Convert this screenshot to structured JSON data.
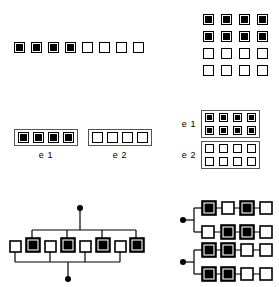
{
  "figure": {
    "colors": {
      "filled": "#000000",
      "empty": "#ffffff",
      "outline": "#000000",
      "group_box": "#555555",
      "background": "#ffffff"
    },
    "legend": {
      "filled_meaning": "filled cell",
      "empty_meaning": "empty cell"
    }
  },
  "panels": {
    "top_left": {
      "name": "single-row-sequence",
      "type": "row",
      "cell_count": 8,
      "cells": [
        "filled",
        "filled",
        "filled",
        "filled",
        "empty",
        "empty",
        "empty",
        "empty"
      ]
    },
    "top_right": {
      "name": "four-by-four-grid",
      "type": "grid",
      "rows": 4,
      "cols": 4,
      "cells": [
        [
          "filled",
          "filled",
          "filled",
          "filled"
        ],
        [
          "filled",
          "filled",
          "filled",
          "filled"
        ],
        [
          "empty",
          "empty",
          "empty",
          "empty"
        ],
        [
          "empty",
          "empty",
          "empty",
          "empty"
        ]
      ]
    },
    "middle_left": {
      "name": "two-boxed-row-groups",
      "type": "boxed-rows",
      "groups": [
        {
          "label": "e 1",
          "cells": [
            "filled",
            "filled",
            "filled",
            "filled"
          ]
        },
        {
          "label": "e 2",
          "cells": [
            "empty",
            "empty",
            "empty",
            "empty"
          ]
        }
      ]
    },
    "middle_right": {
      "name": "two-boxed-grid-groups",
      "type": "boxed-grids",
      "groups": [
        {
          "label": "e 1",
          "rows": [
            [
              "filled",
              "filled",
              "filled",
              "filled"
            ],
            [
              "filled",
              "filled",
              "filled",
              "filled"
            ]
          ]
        },
        {
          "label": "e 2",
          "rows": [
            [
              "empty",
              "empty",
              "empty",
              "empty"
            ],
            [
              "empty",
              "empty",
              "empty",
              "empty"
            ]
          ]
        }
      ]
    },
    "bottom_left": {
      "name": "bus-connected-chain",
      "type": "network",
      "cell_count": 8,
      "cells": [
        "empty",
        "filled",
        "empty",
        "filled",
        "empty",
        "filled",
        "empty",
        "filled"
      ],
      "terminals": 2,
      "terminal_positions": [
        "top",
        "bottom"
      ],
      "description": "eight alternating cells joined by an upper bus to the top terminal and a lower bus to the bottom terminal"
    },
    "bottom_right": {
      "name": "two-terminal-branch-rows",
      "type": "network",
      "terminals": 2,
      "branches": [
        {
          "terminal": 1,
          "rows": [
            [
              "filled",
              "empty",
              "filled",
              "empty"
            ],
            [
              "empty",
              "filled",
              "filled",
              "empty"
            ]
          ]
        },
        {
          "terminal": 2,
          "rows": [
            [
              "filled",
              "filled",
              "empty",
              "empty"
            ],
            [
              "filled",
              "filled",
              "empty",
              "empty"
            ]
          ]
        }
      ],
      "description": "two terminal dots each fanning out into two horizontal chains of four cells"
    }
  }
}
